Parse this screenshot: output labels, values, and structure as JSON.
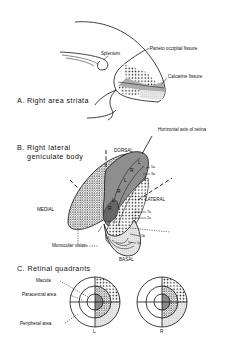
{
  "panel_a": {
    "title": "A. Right area striata",
    "labels": {
      "splenium": "Splenium",
      "parieto_occipital": "Parieto occipital fissure",
      "calcarine": "Calcarine fissure"
    }
  },
  "panel_b": {
    "title_line1": "B. Right lateral",
    "title_line2": "geniculate body",
    "labels": {
      "dorsal": "DORSAL",
      "lateral": "LATERAL",
      "medial": "MEDIAL",
      "basal": "BASAL",
      "horizontal_axis": "Horizontal axis of retina",
      "monocular": "Monocular vision"
    },
    "layer_letters": [
      "L",
      "R",
      "L",
      "R",
      "L",
      "R"
    ],
    "layer_labels": [
      "5a",
      "3a",
      "7a",
      "2a",
      "1b",
      "1a"
    ]
  },
  "panel_c": {
    "title": "C. Retinal quadrants",
    "labels": {
      "macula": "Macula",
      "paracentral": "Paracentral area",
      "peripheral": "Peripheral area"
    },
    "circle_labels": [
      "L",
      "R"
    ]
  },
  "colors": {
    "ink": "#111111",
    "dark_fill": "#8a8a8a",
    "mid_fill": "#b8b8b8",
    "light_fill": "#dedede",
    "background": "#ffffff"
  }
}
